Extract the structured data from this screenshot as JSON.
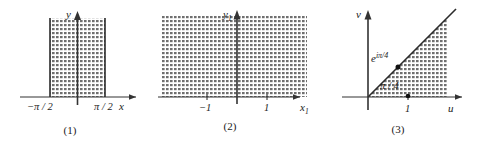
{
  "figure": {
    "panels": [
      {
        "caption": "(1)",
        "axis_x_label": "x",
        "axis_y_label": "y",
        "ticks": [
          {
            "label": "−π / 2",
            "value": -1.5708
          },
          {
            "label": "π / 2",
            "value": 1.5708
          }
        ],
        "region": "vertical strip between x = -pi/2 and x = pi/2, upper portion shaded",
        "shading": "dotted-hatch"
      },
      {
        "caption": "(2)",
        "axis_x_label": "x",
        "axis_x_subscript": "1",
        "axis_y_label": "y",
        "axis_y_subscript": "1",
        "ticks": [
          {
            "label": "−1",
            "value": -1
          },
          {
            "label": "1",
            "value": 1
          }
        ],
        "region": "upper half-plane y1 > 0, fully shaded",
        "shading": "dotted-hatch"
      },
      {
        "caption": "(3)",
        "axis_x_label": "u",
        "axis_y_label": "v",
        "ticks": [
          {
            "label": "1",
            "value": 1
          }
        ],
        "point_label": "e",
        "point_exponent": "iπ/4",
        "angle_label": "π / 4",
        "region": "wedge sector of angle pi/4 between the u-axis and the ray arg = pi/4",
        "shading": "dotted-hatch"
      }
    ],
    "colors": {
      "ink": "#1a1a1a",
      "axis": "#333333",
      "boundary": "#2b2b2b",
      "shade": "#808080",
      "background": "#ffffff"
    }
  }
}
